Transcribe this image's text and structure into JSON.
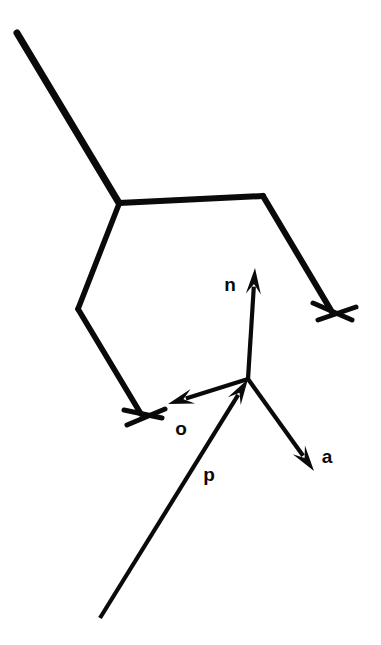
{
  "figure": {
    "background_color": "#ffffff",
    "stroke_color": "#0a0a0a",
    "width": 381,
    "height": 645
  },
  "chart_data": {
    "type": "diagram",
    "xlabel": "",
    "ylabel": "",
    "xlim": [
      0,
      381
    ],
    "ylim": [
      645,
      0
    ],
    "grid": false,
    "legend": "none",
    "labels": [
      {
        "text": "n",
        "x": 230,
        "y": 286
      },
      {
        "text": "o",
        "x": 181,
        "y": 430
      },
      {
        "text": "a",
        "x": 327,
        "y": 458
      },
      {
        "text": "p",
        "x": 209,
        "y": 476
      }
    ],
    "vectors": [
      {
        "name": "n",
        "label": "n",
        "from": [
          248,
          379
        ],
        "to": [
          255,
          268
        ],
        "arrowhead": "end",
        "linewidth": 4.2
      },
      {
        "name": "o",
        "label": "o",
        "from": [
          248,
          379
        ],
        "to": [
          168,
          404
        ],
        "arrowhead": "end",
        "linewidth": 4.2
      },
      {
        "name": "a",
        "label": "a",
        "from": [
          248,
          379
        ],
        "to": [
          314,
          471
        ],
        "arrowhead": "end",
        "linewidth": 4.2
      },
      {
        "name": "p",
        "label": "p",
        "from": [
          100,
          618
        ],
        "to": [
          248,
          379
        ],
        "arrowhead": "end",
        "linewidth": 4.2
      }
    ],
    "links": [
      {
        "name": "upper-link",
        "points": [
          [
            17,
            33
          ],
          [
            119,
            203
          ]
        ],
        "linewidth": 7
      },
      {
        "name": "shoulder-link",
        "points": [
          [
            119,
            203
          ],
          [
            263,
            196
          ]
        ],
        "linewidth": 6
      },
      {
        "name": "right-forearm",
        "points": [
          [
            263,
            196
          ],
          [
            332,
            312
          ]
        ],
        "linewidth": 6
      },
      {
        "name": "left-upper-arm",
        "points": [
          [
            119,
            204
          ],
          [
            78,
            309
          ]
        ],
        "linewidth": 5.5
      },
      {
        "name": "left-forearm",
        "points": [
          [
            78,
            309
          ],
          [
            141,
            414
          ]
        ],
        "linewidth": 5.5
      }
    ],
    "grippers": [
      {
        "name": "right-gripper",
        "at": [
          332,
          312
        ],
        "fingers": [
          {
            "from": [
              313,
              303
            ],
            "to": [
              352,
              320
            ]
          },
          {
            "from": [
              318,
              320
            ],
            "to": [
              356,
              307
            ]
          }
        ],
        "linewidth": 5
      },
      {
        "name": "left-gripper",
        "at": [
          141,
          414
        ],
        "fingers": [
          {
            "from": [
              124,
              410
            ],
            "to": [
              162,
              418
            ]
          },
          {
            "from": [
              127,
              425
            ],
            "to": [
              165,
              409
            ]
          }
        ],
        "linewidth": 5
      }
    ]
  }
}
